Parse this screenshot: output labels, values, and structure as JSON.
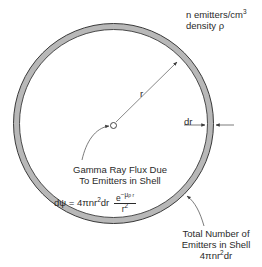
{
  "diagram": {
    "density_label": {
      "line1": "n emitters/cm",
      "line1_sup": "3",
      "line2": "density ρ"
    },
    "radius_label": "r",
    "thickness_label": "dr",
    "flux_label": {
      "line1": "Gamma Ray Flux Due",
      "line2": "To Emitters in Shell"
    },
    "flux_formula": {
      "lhs": "dψ = 4πnr",
      "lhs_sup": "2",
      "lhs_tail": "dr",
      "numerator": "e",
      "numerator_sup": "−μ",
      "numerator_sub": "ρ r",
      "denominator": "r",
      "denominator_sup": "2"
    },
    "total_label": {
      "line1": "Total Number of",
      "line2": "Emitters in Shell",
      "line3": "4πnr",
      "line3_sup": "2",
      "line3_tail": "dr"
    },
    "colors": {
      "ring_fill": "#b8b8b8",
      "ring_stroke": "#3a3a3a",
      "line": "#3a3a3a",
      "text": "#2a2a2a"
    }
  }
}
